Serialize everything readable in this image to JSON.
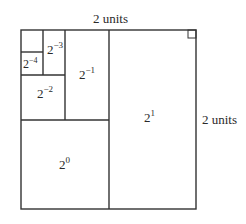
{
  "diagram": {
    "labels": {
      "top": "2 units",
      "right": "2 units"
    },
    "regions": [
      {
        "id": "r1",
        "base": "2",
        "exp": "1"
      },
      {
        "id": "r0",
        "base": "2",
        "exp": "0"
      },
      {
        "id": "rm1",
        "base": "2",
        "exp": "−1"
      },
      {
        "id": "rm2",
        "base": "2",
        "exp": "−2"
      },
      {
        "id": "rm3",
        "base": "2",
        "exp": "−3"
      },
      {
        "id": "rm4",
        "base": "2",
        "exp": "−4"
      }
    ],
    "stroke_color": "#333333",
    "background": "#ffffff"
  }
}
